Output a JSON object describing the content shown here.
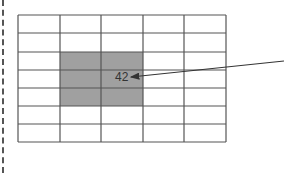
{
  "diagram": {
    "grid": {
      "columns": 5,
      "rows": 7,
      "x": 18,
      "y": 15,
      "col_edges": [
        18,
        60,
        101,
        143,
        184,
        226
      ],
      "row_edges": [
        15,
        33,
        52,
        70,
        88,
        106,
        124,
        142
      ],
      "line_color": "#555555"
    },
    "highlight": {
      "col_start": 1,
      "col_end": 2,
      "row_start": 2,
      "row_end": 4,
      "color": "#a0a0a0"
    },
    "label": {
      "text": "42",
      "x": 115,
      "y": 81
    },
    "arrow": {
      "from": [
        284,
        61
      ],
      "to": [
        131,
        77
      ],
      "color": "#333333"
    }
  }
}
